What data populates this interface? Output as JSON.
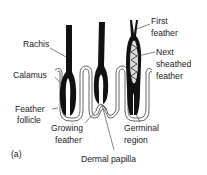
{
  "diagram": {
    "panel_label": "(a)",
    "labels": {
      "rachis": "Rachis",
      "calamus": "Calamus",
      "feather_follicle_1": "Feather",
      "feather_follicle_2": "follicle",
      "growing_feather_1": "Growing",
      "growing_feather_2": "feather",
      "dermal_papilla": "Dermal papilla",
      "germinal_region_1": "Germinal",
      "germinal_region_2": "region",
      "first_feather_1": "First",
      "first_feather_2": "feather",
      "next_sheathed_1": "Next",
      "next_sheathed_2": "sheathed",
      "next_sheathed_3": "feather"
    },
    "colors": {
      "feather": "#111111",
      "skin_outline": "#555555",
      "skin_fill": "#e6e6e6",
      "text": "#1a1a1a"
    }
  }
}
